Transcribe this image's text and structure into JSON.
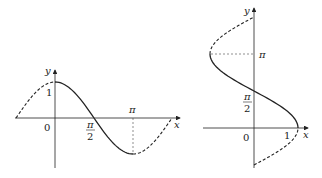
{
  "left_graph": {
    "description": "y = cos x, solid on [0, pi], dashed outside",
    "y_axis_label": "y",
    "x_axis_label": "x",
    "origin_label": "0",
    "y_tick_label": "1",
    "x_ticks": {
      "half_pi_num": "π",
      "half_pi_den": "2",
      "pi": "π"
    }
  },
  "right_graph": {
    "description": "x = cos y, solid on [0, pi], dashed outside",
    "y_axis_label": "y",
    "x_axis_label": "x",
    "origin_label": "0",
    "x_tick_label": "1",
    "y_ticks": {
      "half_pi_num": "π",
      "half_pi_den": "2",
      "pi": "π"
    }
  }
}
